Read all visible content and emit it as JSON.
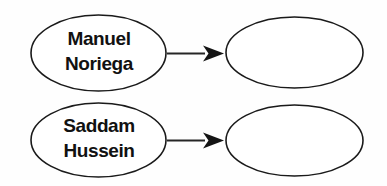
{
  "diagram": {
    "type": "flow-diagram",
    "background_color": "#fefefe",
    "stroke_color": "#1a1a1a",
    "arrow_color": "#141414",
    "text_color": "#111111",
    "rows": [
      {
        "id": "row-noriega",
        "source": {
          "name": "node-manuel-noriega",
          "line1": "Manuel",
          "line2": "Noriega",
          "empty": false
        },
        "target": {
          "name": "node-blank-top",
          "line1": "",
          "line2": "",
          "empty": true
        },
        "connector": {
          "name": "arrow-noriega-to-blank",
          "style": "solid-arrow-right"
        }
      },
      {
        "id": "row-hussein",
        "source": {
          "name": "node-saddam-hussein",
          "line1": "Saddam",
          "line2": "Hussein",
          "empty": false
        },
        "target": {
          "name": "node-blank-bottom",
          "line1": "",
          "line2": "",
          "empty": true
        },
        "connector": {
          "name": "arrow-hussein-to-blank",
          "style": "solid-arrow-right"
        }
      }
    ]
  }
}
